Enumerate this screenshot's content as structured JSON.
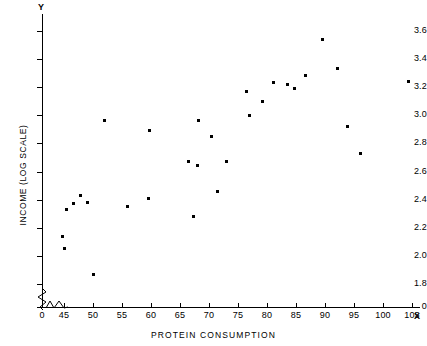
{
  "chart_data": {
    "type": "scatter",
    "title": "",
    "xlabel": "PROTEIN CONSUMPTION",
    "ylabel": "INCOME (LOG SCALE)",
    "x_axis_name": "X",
    "y_axis_name": "Y",
    "xlim": [
      42,
      108
    ],
    "ylim": [
      1.75,
      3.68
    ],
    "grid": false,
    "legend": null,
    "axis_break": {
      "x": true,
      "y": true
    },
    "xticks": [
      0,
      45,
      50,
      55,
      60,
      65,
      70,
      75,
      80,
      85,
      90,
      95,
      100,
      105
    ],
    "xtick_labels": [
      "0",
      "45",
      "50",
      "55",
      "60",
      "65",
      "70",
      "75",
      "80",
      "85",
      "90",
      "95",
      "100",
      "105"
    ],
    "yticks": [
      0,
      1.8,
      2.0,
      2.2,
      2.4,
      2.6,
      2.8,
      3.0,
      3.2,
      3.4,
      3.6
    ],
    "ytick_labels": [
      "0",
      "1.8",
      "2.0",
      "2.2",
      "2.4",
      "2.6",
      "2.8",
      "3.0",
      "3.2",
      "3.4",
      "3.6"
    ],
    "points": [
      {
        "x": 44.8,
        "y": 2.14
      },
      {
        "x": 45.0,
        "y": 2.05
      },
      {
        "x": 45.4,
        "y": 2.33
      },
      {
        "x": 46.6,
        "y": 2.37
      },
      {
        "x": 47.9,
        "y": 2.43
      },
      {
        "x": 49.0,
        "y": 2.38
      },
      {
        "x": 50.0,
        "y": 1.87
      },
      {
        "x": 52.0,
        "y": 2.96
      },
      {
        "x": 56.0,
        "y": 2.35
      },
      {
        "x": 59.5,
        "y": 2.41
      },
      {
        "x": 59.8,
        "y": 2.89
      },
      {
        "x": 66.4,
        "y": 2.67
      },
      {
        "x": 67.3,
        "y": 2.28
      },
      {
        "x": 68.0,
        "y": 2.64
      },
      {
        "x": 68.2,
        "y": 2.96
      },
      {
        "x": 70.5,
        "y": 2.85
      },
      {
        "x": 71.4,
        "y": 2.46
      },
      {
        "x": 73.0,
        "y": 2.67
      },
      {
        "x": 76.4,
        "y": 3.17
      },
      {
        "x": 77.0,
        "y": 3.0
      },
      {
        "x": 79.3,
        "y": 3.1
      },
      {
        "x": 81.2,
        "y": 3.23
      },
      {
        "x": 83.5,
        "y": 3.22
      },
      {
        "x": 84.7,
        "y": 3.19
      },
      {
        "x": 86.7,
        "y": 3.28
      },
      {
        "x": 89.6,
        "y": 3.54
      },
      {
        "x": 92.2,
        "y": 3.33
      },
      {
        "x": 93.8,
        "y": 2.92
      },
      {
        "x": 96.2,
        "y": 2.73
      },
      {
        "x": 104.4,
        "y": 3.24
      }
    ]
  }
}
